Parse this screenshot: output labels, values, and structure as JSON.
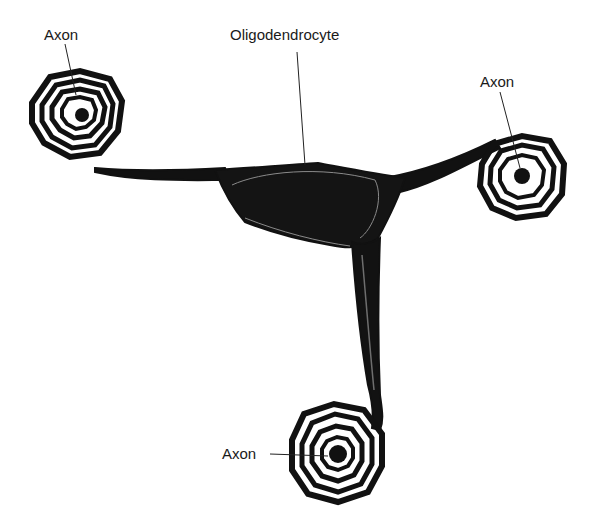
{
  "diagram": {
    "labels": {
      "cell": "Oligodendrocyte",
      "axon_top_left": "Axon",
      "axon_right": "Axon",
      "axon_bottom": "Axon"
    },
    "colors": {
      "ink": "#111111",
      "membrane_gray": "#7a7a7a",
      "background": "#ffffff"
    }
  }
}
